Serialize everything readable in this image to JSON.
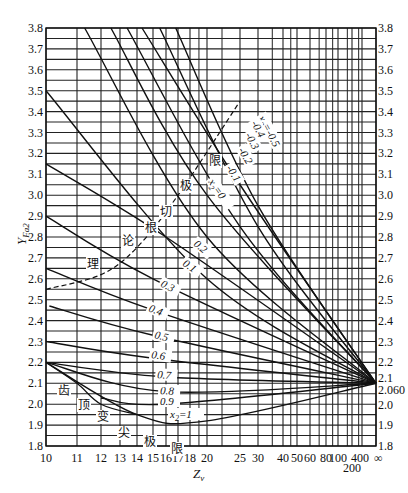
{
  "chart_data": {
    "type": "line",
    "title": "",
    "xlabel": "Z_v",
    "ylabel": "Y_Fa2",
    "x_scale": "nonlinear (approx. 1/Z)",
    "xlim": [
      10,
      "∞"
    ],
    "ylim": [
      1.8,
      3.8
    ],
    "grid": true,
    "x_ticks": [
      "10",
      "11",
      "12",
      "13",
      "14",
      "15",
      "16",
      "17",
      "18",
      "20",
      "25",
      "30",
      "40",
      "50",
      "60",
      "80",
      "100",
      "200",
      "400",
      "∞"
    ],
    "y_ticks_left": [
      "1.8",
      "1.9",
      "2.0",
      "2.1",
      "2.2",
      "2.3",
      "2.4",
      "2.5",
      "2.6",
      "2.7",
      "2.8",
      "2.9",
      "3.0",
      "3.1",
      "3.2",
      "3.3",
      "3.4",
      "3.5",
      "3.6",
      "3.7",
      "3.8"
    ],
    "y_ticks_right": [
      "1.8",
      "1.9",
      "2.0",
      "2.060",
      "2.1",
      "2.2",
      "2.3",
      "2.4",
      "2.5",
      "2.6",
      "2.7",
      "2.8",
      "2.9",
      "3.0",
      "3.1",
      "3.2",
      "3.3",
      "3.4",
      "3.5",
      "3.6",
      "3.7",
      "3.8"
    ],
    "convergence_point": {
      "x": "∞",
      "y": 2.1
    },
    "series": [
      {
        "name": "x2=-0.5",
        "label": "x₂=-0.5",
        "points": [
          [
            16.8,
            3.8
          ],
          [
            30,
            2.95
          ],
          [
            "∞",
            2.1
          ]
        ]
      },
      {
        "name": "x2=-0.4",
        "label": "-0.4",
        "points": [
          [
            15.5,
            3.8
          ],
          [
            30,
            2.85
          ],
          [
            "∞",
            2.1
          ]
        ]
      },
      {
        "name": "x2=-0.3",
        "label": "-0.3",
        "points": [
          [
            14.3,
            3.8
          ],
          [
            25,
            3.05
          ],
          [
            "∞",
            2.1
          ]
        ]
      },
      {
        "name": "x2=-0.2",
        "label": "-0.2",
        "points": [
          [
            13.4,
            3.8
          ],
          [
            25,
            2.85
          ],
          [
            "∞",
            2.1
          ]
        ]
      },
      {
        "name": "x2=-0.1",
        "label": "-0.1",
        "points": [
          [
            12.5,
            3.8
          ],
          [
            20,
            3.0
          ],
          [
            "∞",
            2.1
          ]
        ]
      },
      {
        "name": "x2=0",
        "label": "x₂=0",
        "points": [
          [
            11.3,
            3.8
          ],
          [
            20,
            2.8
          ],
          [
            "∞",
            2.1
          ]
        ]
      },
      {
        "name": "x2=0.1",
        "label": "0.1",
        "points": [
          [
            10,
            3.5
          ],
          [
            20,
            2.6
          ],
          [
            "∞",
            2.1
          ]
        ]
      },
      {
        "name": "x2=0.2",
        "label": "0.2",
        "points": [
          [
            10,
            3.15
          ],
          [
            16,
            2.8
          ],
          [
            "∞",
            2.1
          ]
        ]
      },
      {
        "name": "x2=0.3",
        "label": "0.3",
        "points": [
          [
            10,
            2.9
          ],
          [
            15,
            2.6
          ],
          [
            "∞",
            2.1
          ]
        ]
      },
      {
        "name": "x2=0.4",
        "label": "0.4",
        "points": [
          [
            10,
            2.65
          ],
          [
            15,
            2.45
          ],
          [
            "∞",
            2.1
          ]
        ]
      },
      {
        "name": "x2=0.5",
        "label": "0.5",
        "points": [
          [
            10.1,
            2.47
          ],
          [
            15,
            2.33
          ],
          [
            "∞",
            2.1
          ]
        ]
      },
      {
        "name": "x2=0.6",
        "label": "0.6",
        "points": [
          [
            10,
            2.3
          ],
          [
            15,
            2.22
          ],
          [
            "∞",
            2.1
          ]
        ]
      },
      {
        "name": "x2=0.7",
        "label": "0.7",
        "points": [
          [
            10,
            2.2
          ],
          [
            16,
            2.13
          ],
          [
            "∞",
            2.1
          ]
        ]
      },
      {
        "name": "x2=0.8",
        "label": "0.8",
        "points": [
          [
            10,
            2.2
          ],
          [
            16,
            2.06
          ],
          [
            "∞",
            2.1
          ]
        ]
      },
      {
        "name": "x2=0.9",
        "label": "0.9",
        "points": [
          [
            12,
            2.03
          ],
          [
            16,
            2.0
          ],
          [
            "∞",
            2.1
          ]
        ]
      },
      {
        "name": "x2=1",
        "label": "x₂=1",
        "points": [
          [
            10,
            2.2
          ],
          [
            14,
            1.95
          ],
          [
            20,
            1.92
          ],
          [
            "∞",
            2.1
          ]
        ]
      }
    ],
    "boundaries": [
      {
        "name": "theoretical-undercut-limit",
        "style": "dashed",
        "label": "理论根切极限",
        "points": [
          [
            10,
            2.55
          ],
          [
            12,
            2.62
          ],
          [
            14,
            2.75
          ],
          [
            17,
            3.0
          ],
          [
            25,
            3.45
          ]
        ]
      },
      {
        "name": "tooth-tip-pointing-limit",
        "style": "solid",
        "label": "齿顶变尖极限",
        "points": [
          [
            10,
            2.2
          ],
          [
            11,
            2.1
          ],
          [
            12,
            2.0
          ],
          [
            14,
            1.95
          ]
        ]
      }
    ],
    "annotations": [
      "理",
      "论",
      "根",
      "切",
      "极",
      "限",
      "齿",
      "顶",
      "变",
      "尖",
      "极",
      "限"
    ]
  },
  "labels": {
    "x_axis_title": "Z",
    "x_axis_sub": "v",
    "y_axis_title": "Y",
    "y_axis_sub": "Fa2",
    "x2_prefix": "x",
    "x2_sub": "2"
  }
}
